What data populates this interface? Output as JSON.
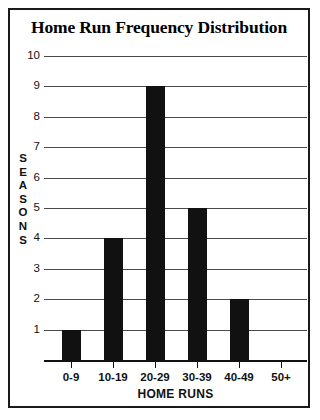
{
  "chart_data": {
    "type": "bar",
    "title": "Home Run Frequency Distribution",
    "xlabel": "HOME RUNS",
    "ylabel": "SEASONS",
    "categories": [
      "0-9",
      "10-19",
      "20-29",
      "30-39",
      "40-49",
      "50+"
    ],
    "values": [
      1,
      4,
      9,
      5,
      2,
      0
    ],
    "ylim": [
      0,
      10
    ],
    "yticks": [
      1,
      2,
      3,
      4,
      5,
      6,
      7,
      8,
      9,
      10
    ],
    "ytick_labels": [
      "1",
      "2",
      "3",
      "4",
      "5",
      "6",
      "7",
      "8",
      "9",
      "10"
    ],
    "grid": true,
    "legend": false,
    "bar_color": "#111111",
    "grid_color": "#4a4a4a",
    "axis_color": "#111111",
    "background_color": "#ffffff",
    "border_color": "#1a1a1a"
  }
}
